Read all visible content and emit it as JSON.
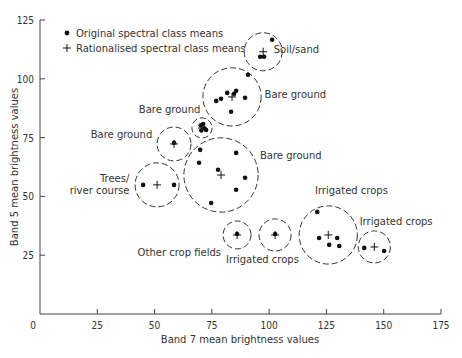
{
  "chart_data": {
    "type": "scatter",
    "title": "",
    "xlabel": "Band 7 mean brightness values",
    "ylabel": "Band 5 mean brightness values",
    "xlim": [
      0,
      175
    ],
    "ylim": [
      0,
      125
    ],
    "xticks": [
      0,
      25,
      50,
      75,
      100,
      125,
      150,
      175
    ],
    "yticks": [
      0,
      25,
      50,
      75,
      100,
      125
    ],
    "grid": false,
    "legend": {
      "position": "upper-left",
      "entries": [
        {
          "marker": "dot",
          "label": "Original spectral class means"
        },
        {
          "marker": "plus",
          "label": "Rationalised spectral class means"
        }
      ]
    },
    "clusters": [
      {
        "label": "Soil/sand",
        "center": [
          97.4,
          111.5
        ],
        "radius": 8.3,
        "label_pos": [
          102,
          111
        ],
        "label_anchor": "start",
        "points": [
          [
            101.3,
            116.6
          ],
          [
            96.1,
            109.4
          ],
          [
            97.8,
            109.4
          ]
        ]
      },
      {
        "label": "Bare ground",
        "center": [
          83.8,
          92.3
        ],
        "radius": 12.7,
        "label_pos": [
          98,
          92
        ],
        "label_anchor": "start",
        "points": [
          [
            90.8,
            101.7
          ],
          [
            76.9,
            90.6
          ],
          [
            79.0,
            91.5
          ],
          [
            81.7,
            94.0
          ],
          [
            85.6,
            94.9
          ],
          [
            84.7,
            93.6
          ],
          [
            89.5,
            91.9
          ],
          [
            83.4,
            86.0
          ]
        ]
      },
      {
        "label": "Bare ground",
        "center": [
          70.7,
          79.1
        ],
        "radius": 4.4,
        "label_pos": [
          70,
          85.5
        ],
        "label_anchor": "end",
        "points": [
          [
            70.2,
            80.2
          ],
          [
            71.8,
            79.0
          ],
          [
            72.5,
            78.2
          ],
          [
            70.4,
            78.0
          ],
          [
            71.2,
            80.8
          ]
        ]
      },
      {
        "label": "Bare ground",
        "center": [
          58.5,
          72.3
        ],
        "radius": 7.4,
        "label_pos": [
          49,
          75
        ],
        "label_anchor": "end",
        "points": [
          [
            58.5,
            72.8
          ]
        ]
      },
      {
        "label": "Bare ground",
        "center": [
          79.0,
          59.1
        ],
        "radius": 16.2,
        "label_pos": [
          96,
          66
        ],
        "label_anchor": "start",
        "points": [
          [
            69.9,
            69.8
          ],
          [
            85.6,
            68.5
          ],
          [
            69.4,
            64.3
          ],
          [
            77.7,
            61.3
          ],
          [
            89.5,
            57.9
          ],
          [
            85.6,
            52.8
          ],
          [
            74.7,
            47.2
          ]
        ]
      },
      {
        "label": "Trees/\nriver course",
        "center": [
          51.1,
          54.9
        ],
        "radius": 9.6,
        "label_pos": [
          39,
          56
        ],
        "label_anchor": "end",
        "points": [
          [
            45.0,
            54.9
          ],
          [
            58.5,
            54.9
          ]
        ]
      },
      {
        "label": "Other crop fields",
        "center": [
          86.0,
          33.6
        ],
        "radius": 6.1,
        "label_pos": [
          79,
          24.5
        ],
        "label_anchor": "end",
        "points": [
          [
            86.0,
            34.0
          ]
        ]
      },
      {
        "label": "Irrigated crops",
        "center": [
          102.6,
          33.6
        ],
        "radius": 7.0,
        "label_pos": [
          113,
          21.5
        ],
        "label_anchor": "end",
        "points": [
          [
            102.6,
            34.0
          ]
        ]
      },
      {
        "label": "Irrigated crops",
        "center": [
          125.8,
          33.6
        ],
        "radius": 12.7,
        "label_pos": [
          120,
          51
        ],
        "label_anchor": "start",
        "points": [
          [
            121.0,
            43.4
          ],
          [
            121.8,
            32.3
          ],
          [
            126.2,
            29.4
          ],
          [
            129.7,
            32.3
          ],
          [
            130.6,
            28.9
          ]
        ]
      },
      {
        "label": "Irrigated crops",
        "center": [
          145.9,
          28.5
        ],
        "radius": 7.0,
        "label_pos": [
          139.5,
          38
        ],
        "label_anchor": "start",
        "points": [
          [
            141.5,
            28.1
          ],
          [
            150.2,
            26.8
          ]
        ]
      }
    ]
  },
  "axes": {
    "x_title": "Band 7 mean brightness values",
    "y_title": "Band 5 mean brightness values"
  },
  "legend": {
    "dot_label": "Original spectral class means",
    "plus_label": "Rationalised spectral class means"
  }
}
